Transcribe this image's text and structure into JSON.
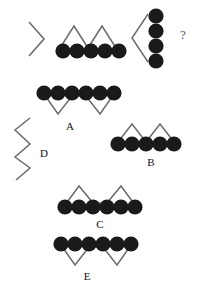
{
  "puzzle": {
    "type": "visual-analogy-sequence",
    "background_color": "#ffffff",
    "dot_color": "#1a1a1a",
    "line_color": "#6b6b6b",
    "label_color": "#111111",
    "question_mark": "?",
    "prompt_row": {
      "name": "question-row",
      "items": [
        {
          "name": "chevron-right-glyph",
          "kind": "chevron",
          "direction": "right",
          "dot_count": 0,
          "label": ""
        },
        {
          "name": "five-dots-with-zigzag-above",
          "kind": "dots-with-zigzag",
          "orientation": "horizontal",
          "dot_count": 5,
          "zigzag_side": "above",
          "zigzag_peaks": 2,
          "label": ""
        },
        {
          "name": "four-dots-vertical-with-chevron",
          "kind": "dots-with-chevron",
          "orientation": "vertical",
          "dot_count": 4,
          "chevron_side": "left",
          "label": ""
        },
        {
          "name": "answer-placeholder",
          "kind": "question-mark",
          "dot_count": 0,
          "label": "?"
        }
      ]
    },
    "options": [
      {
        "name": "option-a",
        "label": "A",
        "kind": "dots-with-zigzag",
        "orientation": "horizontal",
        "dot_count": 6,
        "zigzag_side": "below",
        "zigzag_peaks": 2
      },
      {
        "name": "option-b",
        "label": "B",
        "kind": "dots-with-zigzag",
        "orientation": "horizontal",
        "dot_count": 5,
        "zigzag_side": "above",
        "zigzag_peaks": 2
      },
      {
        "name": "option-c",
        "label": "C",
        "kind": "dots-with-zigzag",
        "orientation": "horizontal",
        "dot_count": 6,
        "zigzag_side": "above",
        "zigzag_peaks": 2
      },
      {
        "name": "option-d",
        "label": "D",
        "kind": "zigzag-only",
        "orientation": "vertical",
        "dot_count": 0,
        "zigzag_side": "none",
        "zigzag_peaks": 3
      },
      {
        "name": "option-e",
        "label": "E",
        "kind": "dots-with-zigzag",
        "orientation": "horizontal",
        "dot_count": 6,
        "zigzag_side": "below",
        "zigzag_peaks": 2
      }
    ]
  }
}
